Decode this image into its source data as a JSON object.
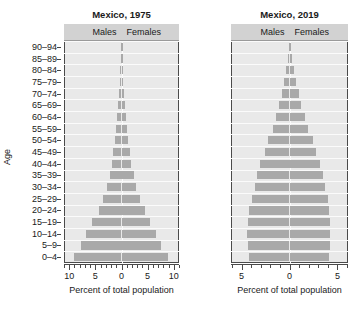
{
  "figure": {
    "ylabel": "Age",
    "age_groups": [
      "0–4",
      "5–9",
      "10–14",
      "15–19",
      "20–24",
      "25–29",
      "30–34",
      "35–39",
      "40–44",
      "45–49",
      "50–54",
      "55–59",
      "60–64",
      "65–69",
      "70–74",
      "75–79",
      "80–84",
      "85–89",
      "90–94"
    ],
    "series_labels": {
      "males": "Males",
      "females": "Females"
    },
    "xlabel": "Percent of total population",
    "colors": {
      "bar": "#a9a9a9",
      "plot_background": "#e9e9e9",
      "header_background": "#d2d2d2",
      "gridline": "#fbfbfb",
      "axis": "#4a4a4a",
      "text": "#1a1a1a"
    }
  },
  "chart_data": [
    {
      "type": "bar",
      "title": "Mexico, 1975",
      "subtype": "population-pyramid",
      "xlabel": "Percent of total population",
      "ylabel": "Age",
      "categories": [
        "0–4",
        "5–9",
        "10–14",
        "15–19",
        "20–24",
        "25–29",
        "30–34",
        "35–39",
        "40–44",
        "45–49",
        "50–54",
        "55–59",
        "60–64",
        "65–69",
        "70–74",
        "75–79",
        "80–84",
        "85–89",
        "90–94"
      ],
      "series": [
        {
          "name": "Males",
          "values": [
            9.1,
            7.7,
            6.8,
            5.6,
            4.4,
            3.5,
            2.7,
            2.2,
            1.9,
            1.6,
            1.3,
            1.0,
            0.85,
            0.6,
            0.45,
            0.3,
            0.2,
            0.1,
            0.05
          ]
        },
        {
          "name": "Females",
          "values": [
            8.9,
            7.5,
            6.6,
            5.5,
            4.4,
            3.5,
            2.8,
            2.3,
            1.9,
            1.6,
            1.3,
            1.1,
            0.9,
            0.65,
            0.5,
            0.33,
            0.22,
            0.11,
            0.06
          ]
        }
      ],
      "xticks": [
        10,
        5,
        0,
        5,
        10
      ],
      "xlim": [
        11,
        11
      ],
      "minor_ticks_per_interval": 5,
      "grid": true,
      "legend_position": "top-inside-header"
    },
    {
      "type": "bar",
      "title": "Mexico, 2019",
      "subtype": "population-pyramid",
      "xlabel": "Percent of total population",
      "ylabel": "Age",
      "categories": [
        "0–4",
        "5–9",
        "10–14",
        "15–19",
        "20–24",
        "25–29",
        "30–34",
        "35–39",
        "40–44",
        "45–49",
        "50–54",
        "55–59",
        "60–64",
        "65–69",
        "70–74",
        "75–79",
        "80–84",
        "85–89",
        "90–94"
      ],
      "series": [
        {
          "name": "Males",
          "values": [
            4.25,
            4.35,
            4.4,
            4.35,
            4.2,
            3.95,
            3.6,
            3.35,
            3.05,
            2.6,
            2.2,
            1.75,
            1.4,
            1.05,
            0.8,
            0.55,
            0.35,
            0.18,
            0.08
          ]
        },
        {
          "name": "Females",
          "values": [
            4.1,
            4.2,
            4.25,
            4.25,
            4.15,
            4.0,
            3.75,
            3.5,
            3.2,
            2.8,
            2.4,
            1.95,
            1.6,
            1.2,
            0.95,
            0.68,
            0.45,
            0.24,
            0.12
          ]
        }
      ],
      "xticks": [
        5,
        0,
        5
      ],
      "xlim": [
        6.1,
        6.1
      ],
      "minor_ticks_per_interval": 5,
      "grid": true,
      "legend_position": "top-inside-header"
    }
  ]
}
